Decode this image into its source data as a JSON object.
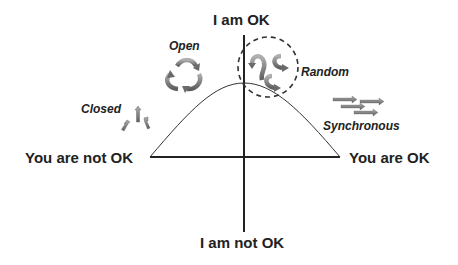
{
  "diagram": {
    "axes": {
      "top": "I am OK",
      "bottom": "I am not OK",
      "left": "You are not OK",
      "right": "You are OK"
    },
    "styles": [
      {
        "label": "Closed",
        "icon": "three-upward-arrows-icon"
      },
      {
        "label": "Open",
        "icon": "circular-recycle-arrows-icon"
      },
      {
        "label": "Random",
        "icon": "scattered-curved-arrows-icon"
      },
      {
        "label": "Synchronous",
        "icon": "parallel-right-arrows-icon"
      }
    ],
    "colors": {
      "text": "#222222",
      "line": "#222222",
      "arrow_fill": "#8a8a8a",
      "arrow_shade": "#5a5a5a"
    }
  }
}
